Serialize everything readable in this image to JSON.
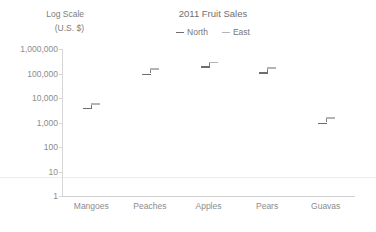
{
  "chart_data": {
    "type": "scatter",
    "title": "2011 Fruit Sales",
    "xlabel": "",
    "ylabel": "Log Scale (U.S. $)",
    "ylabel_line1": "Log Scale",
    "ylabel_line2": "(U.S. $)",
    "yscale": "log",
    "ylim": [
      1,
      1000000
    ],
    "ytick_labels": [
      "1,000,000",
      "100,000",
      "10,000",
      "1,000",
      "100",
      "10",
      "1"
    ],
    "ytick_values": [
      1000000,
      100000,
      10000,
      1000,
      100,
      10,
      1
    ],
    "grid": false,
    "legend_position": "top-center",
    "categories": [
      "Mangoes",
      "Peaches",
      "Apples",
      "Pears",
      "Guavas"
    ],
    "series": [
      {
        "name": "North",
        "color": "#6e6e6e",
        "values": [
          4000,
          100000,
          200000,
          110000,
          1000
        ]
      },
      {
        "name": "East",
        "color": "#b4b4b4",
        "values": [
          6000,
          160000,
          300000,
          180000,
          1600
        ]
      }
    ]
  },
  "colors": {
    "axis": "#d6d6d6",
    "text": "#8c8c8c",
    "title": "#6f6f6f",
    "north": "#6e6e6e",
    "east": "#b4b4b4",
    "background": "#ffffff"
  }
}
